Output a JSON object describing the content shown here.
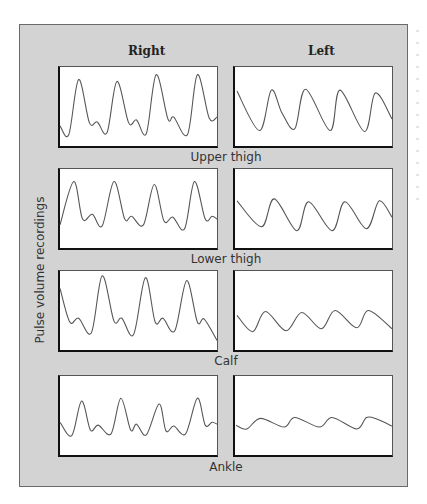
{
  "figure": {
    "columns": [
      "Right",
      "Left"
    ],
    "y_axis_label": "Pulse volume recordings",
    "rows": [
      {
        "label": "Upper thigh"
      },
      {
        "label": "Lower thigh"
      },
      {
        "label": "Calf"
      },
      {
        "label": "Ankle"
      }
    ]
  },
  "colors": {
    "background": "#d3d3d3",
    "panel": "#ffffff",
    "trace": "#555555",
    "axis": "#111111"
  },
  "chart_data": {
    "type": "line",
    "title": "",
    "ylabel": "Pulse volume recordings",
    "xlabel": "",
    "grid": false,
    "legend": "none",
    "panel_coords": "panel-local pixels, x 0-160 (time), y 0-82 (top=0; smaller y = higher amplitude)",
    "panels": [
      {
        "row": "Upper thigh",
        "side": "Right",
        "points": [
          [
            0,
            61
          ],
          [
            9,
            70
          ],
          [
            19,
            13
          ],
          [
            30,
            58
          ],
          [
            38,
            57
          ],
          [
            48,
            68
          ],
          [
            58,
            15
          ],
          [
            70,
            58
          ],
          [
            78,
            55
          ],
          [
            88,
            69
          ],
          [
            98,
            8
          ],
          [
            110,
            54
          ],
          [
            116,
            52
          ],
          [
            130,
            70
          ],
          [
            140,
            8
          ],
          [
            152,
            53
          ],
          [
            160,
            52
          ]
        ]
      },
      {
        "row": "Upper thigh",
        "side": "Left",
        "points": [
          [
            2,
            25
          ],
          [
            25,
            66
          ],
          [
            37,
            24
          ],
          [
            48,
            48
          ],
          [
            61,
            64
          ],
          [
            72,
            23
          ],
          [
            97,
            66
          ],
          [
            107,
            24
          ],
          [
            132,
            67
          ],
          [
            143,
            27
          ],
          [
            160,
            54
          ]
        ]
      },
      {
        "row": "Lower thigh",
        "side": "Right",
        "points": [
          [
            0,
            58
          ],
          [
            14,
            13
          ],
          [
            23,
            52
          ],
          [
            33,
            47
          ],
          [
            43,
            59
          ],
          [
            55,
            13
          ],
          [
            66,
            52
          ],
          [
            73,
            49
          ],
          [
            85,
            58
          ],
          [
            96,
            16
          ],
          [
            106,
            54
          ],
          [
            115,
            50
          ],
          [
            127,
            62
          ],
          [
            137,
            13
          ],
          [
            148,
            52
          ],
          [
            155,
            49
          ],
          [
            160,
            52
          ]
        ]
      },
      {
        "row": "Lower thigh",
        "side": "Left",
        "points": [
          [
            2,
            33
          ],
          [
            27,
            60
          ],
          [
            40,
            31
          ],
          [
            63,
            64
          ],
          [
            75,
            34
          ],
          [
            99,
            64
          ],
          [
            112,
            34
          ],
          [
            134,
            62
          ],
          [
            147,
            33
          ],
          [
            160,
            50
          ]
        ]
      },
      {
        "row": "Calf",
        "side": "Right",
        "points": [
          [
            0,
            18
          ],
          [
            10,
            53
          ],
          [
            19,
            49
          ],
          [
            32,
            64
          ],
          [
            43,
            5
          ],
          [
            55,
            52
          ],
          [
            63,
            49
          ],
          [
            75,
            66
          ],
          [
            87,
            7
          ],
          [
            97,
            53
          ],
          [
            105,
            49
          ],
          [
            117,
            62
          ],
          [
            129,
            10
          ],
          [
            140,
            53
          ],
          [
            147,
            50
          ],
          [
            160,
            72
          ]
        ]
      },
      {
        "row": "Calf",
        "side": "Left",
        "points": [
          [
            2,
            46
          ],
          [
            18,
            63
          ],
          [
            31,
            42
          ],
          [
            52,
            62
          ],
          [
            68,
            43
          ],
          [
            88,
            60
          ],
          [
            102,
            41
          ],
          [
            124,
            59
          ],
          [
            136,
            41
          ],
          [
            160,
            60
          ]
        ]
      },
      {
        "row": "Ankle",
        "side": "Right",
        "points": [
          [
            0,
            48
          ],
          [
            12,
            62
          ],
          [
            22,
            26
          ],
          [
            31,
            56
          ],
          [
            39,
            51
          ],
          [
            52,
            60
          ],
          [
            62,
            23
          ],
          [
            72,
            56
          ],
          [
            78,
            50
          ],
          [
            88,
            61
          ],
          [
            101,
            29
          ],
          [
            108,
            57
          ],
          [
            116,
            52
          ],
          [
            128,
            60
          ],
          [
            140,
            23
          ],
          [
            148,
            51
          ],
          [
            155,
            48
          ],
          [
            160,
            50
          ]
        ]
      },
      {
        "row": "Ankle",
        "side": "Left",
        "points": [
          [
            1,
            51
          ],
          [
            12,
            55
          ],
          [
            26,
            44
          ],
          [
            50,
            53
          ],
          [
            61,
            43
          ],
          [
            86,
            53
          ],
          [
            99,
            43
          ],
          [
            124,
            55
          ],
          [
            134,
            43
          ],
          [
            145,
            45
          ],
          [
            160,
            52
          ]
        ]
      }
    ]
  }
}
